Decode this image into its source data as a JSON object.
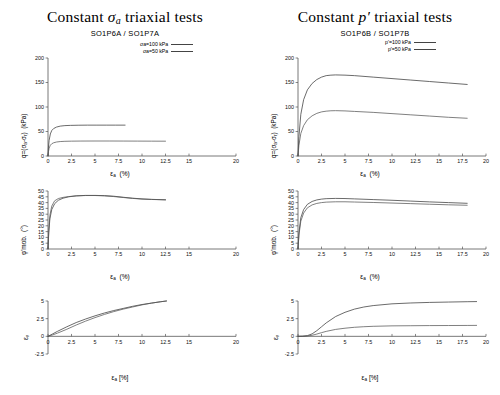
{
  "figure": {
    "panels": [
      {
        "id": "left",
        "title_pre": "Constant ",
        "title_sym": "σ",
        "title_sub": "a",
        "title_post": " triaxial tests",
        "subtitle": "SO1P6A / SO1P7A"
      },
      {
        "id": "right",
        "title_pre": "Constant ",
        "title_sym": "p",
        "title_sub": "′",
        "title_post": " triaxial tests",
        "subtitle": "SO1P6B / SO1P7B"
      }
    ]
  },
  "chart_data": [
    {
      "id": "left-top",
      "type": "line",
      "title": "",
      "xlabel": "εa  (%)",
      "ylabel": "q=(σa-σr)  (kPa)",
      "xlim": [
        0,
        20
      ],
      "ylim": [
        0,
        200
      ],
      "xticks": [
        0,
        2.5,
        5,
        7.5,
        10,
        12.5,
        15,
        20
      ],
      "xticklabels": [
        "0",
        "2.5",
        "5",
        "7.5",
        "10",
        "12.5",
        "15",
        "20"
      ],
      "yticks": [
        0,
        50,
        100,
        150,
        200
      ],
      "yticklabels": [
        "0",
        "50",
        "100",
        "150",
        "200"
      ],
      "grid": false,
      "legend_position": "top-right",
      "series": [
        {
          "name": "σa=100 kPa",
          "x": [
            0,
            0.05,
            0.12,
            0.25,
            0.4,
            0.6,
            0.9,
            1.3,
            1.8,
            2.4,
            3.2,
            4.2,
            5.2,
            6.2,
            7.2,
            8.2
          ],
          "values": [
            0,
            18,
            32,
            45,
            52,
            56,
            59,
            61,
            62,
            62.5,
            62.8,
            63,
            63,
            63,
            63,
            63
          ]
        },
        {
          "name": "σa=50 kPa",
          "x": [
            0,
            0.05,
            0.12,
            0.25,
            0.4,
            0.6,
            0.9,
            1.3,
            1.8,
            2.5,
            3.5,
            5,
            6.5,
            8,
            9.5,
            11,
            12.5
          ],
          "values": [
            0,
            9,
            16,
            22,
            25,
            27,
            28.5,
            29.5,
            30,
            30.3,
            30.5,
            30.6,
            30.6,
            30.5,
            30.4,
            30.3,
            30.2
          ]
        }
      ]
    },
    {
      "id": "left-mid",
      "type": "line",
      "title": "",
      "xlabel": "εa  (%)",
      "ylabel": "φ'mob.  (°)",
      "xlim": [
        0,
        20
      ],
      "ylim": [
        0,
        50
      ],
      "xticks": [
        0,
        2.5,
        5,
        7.5,
        10,
        12.5,
        15,
        20
      ],
      "xticklabels": [
        "0",
        "2.5",
        "5",
        "7.5",
        "10",
        "12.5",
        "15",
        "20"
      ],
      "yticks": [
        0,
        5,
        10,
        15,
        20,
        25,
        30,
        35,
        40,
        45,
        50
      ],
      "yticklabels": [
        "0",
        "5",
        "10",
        "15",
        "20",
        "25",
        "30",
        "35",
        "40",
        "45",
        "50"
      ],
      "grid": false,
      "legend_position": "none",
      "series": [
        {
          "name": "σa=100 kPa",
          "x": [
            0,
            0.08,
            0.2,
            0.4,
            0.7,
            1.1,
            1.6,
            2.2,
            3,
            4,
            5,
            6,
            7,
            8,
            9,
            10,
            11,
            12.5
          ],
          "values": [
            0,
            14,
            26,
            34,
            39,
            42,
            43.8,
            45,
            45.8,
            46.2,
            46.2,
            46,
            45.5,
            44.6,
            43.8,
            43.2,
            42.8,
            42.4
          ]
        },
        {
          "name": "σa=50 kPa",
          "x": [
            0,
            0.08,
            0.2,
            0.4,
            0.7,
            1.1,
            1.6,
            2.2,
            3,
            4,
            5,
            6,
            7,
            8,
            9,
            10,
            11,
            12.5
          ],
          "values": [
            0,
            16,
            29,
            37,
            41.5,
            43.5,
            44.5,
            45.2,
            45.8,
            46.1,
            46.1,
            45.8,
            45.2,
            44.4,
            43.6,
            43,
            42.7,
            42.4
          ]
        }
      ]
    },
    {
      "id": "left-bot",
      "type": "line",
      "title": "",
      "xlabel": "εa [%]",
      "ylabel": "εv",
      "xlim": [
        0,
        20
      ],
      "ylim": [
        -2.5,
        5
      ],
      "xticks": [
        0,
        2.5,
        5,
        7.5,
        10,
        12.5,
        15,
        20
      ],
      "xticklabels": [
        "0",
        "2.5",
        "5",
        "7.5",
        "10",
        "12.5",
        "15",
        "20"
      ],
      "yticks": [
        -2.5,
        0,
        2.5,
        5
      ],
      "yticklabels": [
        "-2.5",
        "0",
        "2.5",
        "5"
      ],
      "grid": false,
      "legend_position": "none",
      "series": [
        {
          "name": "σa=100 kPa",
          "x": [
            0,
            0.5,
            1,
            2,
            3,
            4,
            5,
            6,
            7,
            8,
            9,
            10,
            11,
            12,
            12.6
          ],
          "values": [
            0,
            0.35,
            0.7,
            1.35,
            1.95,
            2.45,
            2.9,
            3.3,
            3.65,
            3.95,
            4.25,
            4.5,
            4.7,
            4.9,
            5.0
          ]
        },
        {
          "name": "σa=50 kPa",
          "x": [
            0,
            0.5,
            1,
            2,
            3,
            4,
            5,
            6,
            7,
            8,
            9,
            10,
            11,
            12,
            12.6
          ],
          "values": [
            0,
            0.2,
            0.45,
            1.0,
            1.6,
            2.15,
            2.65,
            3.1,
            3.5,
            3.85,
            4.15,
            4.45,
            4.7,
            4.9,
            5.0
          ]
        }
      ]
    },
    {
      "id": "right-top",
      "type": "line",
      "title": "",
      "xlabel": "εa  (%)",
      "ylabel": "q=(σa-σr)  (kPa)",
      "xlim": [
        0,
        20
      ],
      "ylim": [
        0,
        200
      ],
      "xticks": [
        0,
        2.5,
        5,
        7.5,
        10,
        12.5,
        15,
        17.5,
        20
      ],
      "xticklabels": [
        "0",
        "2.5",
        "5",
        "7.5",
        "10",
        "12.5",
        "15",
        "17.5",
        "20"
      ],
      "yticks": [
        0,
        50,
        100,
        150,
        200
      ],
      "yticklabels": [
        "0",
        "50",
        "100",
        "150",
        "200"
      ],
      "grid": false,
      "legend_position": "top-right",
      "series": [
        {
          "name": "p'=100 kPa",
          "x": [
            0,
            0.1,
            0.3,
            0.6,
            1,
            1.5,
            2,
            2.5,
            3,
            3.5,
            4,
            5,
            6,
            8,
            10,
            12,
            14,
            16,
            18
          ],
          "values": [
            0,
            40,
            85,
            115,
            135,
            148,
            156,
            161,
            164,
            165,
            165.5,
            165,
            164,
            161,
            158,
            155,
            152,
            149,
            146
          ]
        },
        {
          "name": "p'=50 kPa",
          "x": [
            0,
            0.1,
            0.3,
            0.6,
            1,
            1.5,
            2,
            2.5,
            3,
            3.5,
            4,
            5,
            6,
            8,
            10,
            12,
            14,
            16,
            18
          ],
          "values": [
            0,
            22,
            46,
            62,
            74,
            82,
            87,
            90,
            91.5,
            92.3,
            92.5,
            92,
            91,
            89,
            86.5,
            84,
            81.5,
            79,
            77
          ]
        }
      ]
    },
    {
      "id": "right-mid",
      "type": "line",
      "title": "",
      "xlabel": "εa  (%)",
      "ylabel": "φ'mob.  (°)",
      "xlim": [
        0,
        20
      ],
      "ylim": [
        0,
        50
      ],
      "xticks": [
        0,
        2.5,
        5,
        7.5,
        10,
        12.5,
        15,
        17.5,
        20
      ],
      "xticklabels": [
        "0",
        "2.5",
        "5",
        "7.5",
        "10",
        "12.5",
        "15",
        "17.5",
        "20"
      ],
      "yticks": [
        0,
        5,
        10,
        15,
        20,
        25,
        30,
        35,
        40,
        45,
        50
      ],
      "yticklabels": [
        "0",
        "5",
        "10",
        "15",
        "20",
        "25",
        "30",
        "35",
        "40",
        "45",
        "50"
      ],
      "grid": false,
      "legend_position": "none",
      "series": [
        {
          "name": "p'=100 kPa",
          "x": [
            0,
            0.1,
            0.3,
            0.6,
            1,
            1.5,
            2,
            2.5,
            3,
            4,
            5,
            6,
            8,
            10,
            12,
            14,
            16,
            18
          ],
          "values": [
            0,
            14,
            27,
            34,
            38.5,
            41,
            42.3,
            43,
            43.4,
            43.6,
            43.5,
            43.2,
            42.6,
            42,
            41.3,
            40.6,
            40,
            39.4
          ]
        },
        {
          "name": "p'=50 kPa",
          "x": [
            0,
            0.1,
            0.3,
            0.6,
            1,
            1.5,
            2,
            2.5,
            3,
            4,
            5,
            6,
            8,
            10,
            12,
            14,
            16,
            18
          ],
          "values": [
            0,
            12,
            24,
            31,
            35.5,
            38,
            39.3,
            40,
            40.4,
            40.7,
            40.7,
            40.5,
            40.1,
            39.6,
            39.1,
            38.6,
            38.1,
            37.7
          ]
        }
      ]
    },
    {
      "id": "right-bot",
      "type": "line",
      "title": "",
      "xlabel": "εa [%]",
      "ylabel": "εv",
      "xlim": [
        0,
        20
      ],
      "ylim": [
        -2.5,
        5
      ],
      "xticks": [
        0,
        2.5,
        5,
        7.5,
        10,
        12.5,
        15,
        17.5,
        20
      ],
      "xticklabels": [
        "0",
        "2.5",
        "5",
        "7.5",
        "10",
        "12.5",
        "15",
        "17.5",
        "20"
      ],
      "yticks": [
        -2.5,
        0,
        2.5,
        5
      ],
      "yticklabels": [
        "-2.5",
        "0",
        "2.5",
        "5"
      ],
      "grid": false,
      "legend_position": "none",
      "series": [
        {
          "name": "p'=100 kPa",
          "x": [
            0,
            0.5,
            1,
            1.5,
            2,
            2.5,
            3,
            4,
            5,
            6,
            7,
            8,
            10,
            12,
            14,
            16,
            18,
            19
          ],
          "values": [
            0,
            0.02,
            0.1,
            0.35,
            0.8,
            1.35,
            1.9,
            2.8,
            3.4,
            3.85,
            4.15,
            4.35,
            4.6,
            4.72,
            4.8,
            4.85,
            4.9,
            4.92
          ]
        },
        {
          "name": "p'=50 kPa",
          "x": [
            0,
            0.5,
            1,
            1.5,
            2,
            2.5,
            3,
            4,
            5,
            6,
            7,
            8,
            10,
            12,
            14,
            16,
            18,
            19
          ],
          "values": [
            0,
            0.01,
            0.05,
            0.15,
            0.32,
            0.52,
            0.7,
            0.98,
            1.15,
            1.28,
            1.36,
            1.42,
            1.48,
            1.5,
            1.52,
            1.53,
            1.54,
            1.55
          ]
        }
      ]
    }
  ],
  "legends": {
    "left": [
      {
        "label": "σa=100 kPa",
        "sym": "σ",
        "sub": "a",
        "rest": "=100 kPa"
      },
      {
        "label": "σa=50 kPa",
        "sym": "σ",
        "sub": "a",
        "rest": "=50 kPa"
      }
    ],
    "right": [
      {
        "label": "p'=100 kPa",
        "sym": "p",
        "sub": "'",
        "rest": "=100 kPa"
      },
      {
        "label": "p'=50 kPa",
        "sym": "p",
        "sub": "'",
        "rest": "=50 kPa"
      }
    ]
  }
}
